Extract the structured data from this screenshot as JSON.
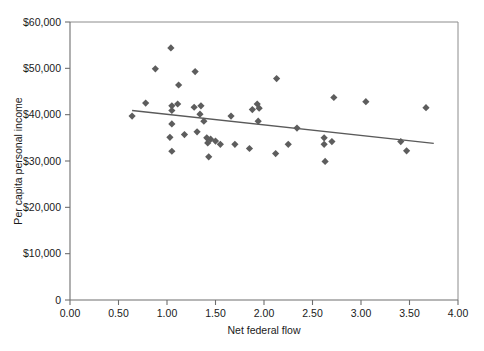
{
  "chart_data": {
    "type": "scatter",
    "title": "",
    "xlabel": "Net federal flow",
    "ylabel": "Per capita personal income",
    "xlim": [
      0,
      4
    ],
    "ylim": [
      0,
      60000
    ],
    "grid": false,
    "legend": null,
    "xticks": [
      "0.00",
      "0.50",
      "1.00",
      "1.50",
      "2.00",
      "2.50",
      "3.00",
      "3.50",
      "4.00"
    ],
    "xtick_values": [
      0,
      0.5,
      1,
      1.5,
      2,
      2.5,
      3,
      3.5,
      4
    ],
    "yticks": [
      "0",
      "$10,000",
      "$20,000",
      "$30,000",
      "$40,000",
      "$50,000",
      "$60,000"
    ],
    "ytick_values": [
      0,
      10000,
      20000,
      30000,
      40000,
      50000,
      60000
    ],
    "marker_shape": "diamond",
    "marker_color": "#5d5d5d",
    "points": [
      {
        "x": 0.64,
        "y": 39700
      },
      {
        "x": 0.78,
        "y": 42500
      },
      {
        "x": 0.88,
        "y": 49900
      },
      {
        "x": 1.04,
        "y": 54400
      },
      {
        "x": 1.05,
        "y": 41900
      },
      {
        "x": 1.11,
        "y": 42300
      },
      {
        "x": 1.05,
        "y": 40900
      },
      {
        "x": 1.12,
        "y": 46400
      },
      {
        "x": 1.05,
        "y": 38000
      },
      {
        "x": 1.03,
        "y": 35100
      },
      {
        "x": 1.18,
        "y": 35700
      },
      {
        "x": 1.05,
        "y": 32100
      },
      {
        "x": 1.29,
        "y": 49300
      },
      {
        "x": 1.28,
        "y": 41600
      },
      {
        "x": 1.35,
        "y": 41900
      },
      {
        "x": 1.34,
        "y": 40100
      },
      {
        "x": 1.38,
        "y": 38600
      },
      {
        "x": 1.31,
        "y": 36300
      },
      {
        "x": 1.41,
        "y": 35000
      },
      {
        "x": 1.45,
        "y": 34700
      },
      {
        "x": 1.5,
        "y": 34300
      },
      {
        "x": 1.42,
        "y": 33900
      },
      {
        "x": 1.55,
        "y": 33600
      },
      {
        "x": 1.43,
        "y": 30900
      },
      {
        "x": 1.66,
        "y": 39700
      },
      {
        "x": 1.7,
        "y": 33600
      },
      {
        "x": 1.88,
        "y": 41100
      },
      {
        "x": 1.93,
        "y": 42300
      },
      {
        "x": 1.95,
        "y": 41400
      },
      {
        "x": 1.94,
        "y": 38600
      },
      {
        "x": 1.85,
        "y": 32700
      },
      {
        "x": 2.13,
        "y": 47800
      },
      {
        "x": 2.12,
        "y": 31600
      },
      {
        "x": 2.25,
        "y": 33600
      },
      {
        "x": 2.34,
        "y": 37100
      },
      {
        "x": 2.62,
        "y": 35000
      },
      {
        "x": 2.7,
        "y": 34200
      },
      {
        "x": 2.62,
        "y": 33600
      },
      {
        "x": 2.72,
        "y": 43700
      },
      {
        "x": 2.63,
        "y": 29900
      },
      {
        "x": 3.05,
        "y": 42800
      },
      {
        "x": 3.41,
        "y": 34200
      },
      {
        "x": 3.47,
        "y": 32200
      },
      {
        "x": 3.67,
        "y": 41500
      }
    ],
    "trendline": {
      "x0": 0.64,
      "y0": 40900,
      "x1": 3.75,
      "y1": 33800,
      "color": "#5a5a5a"
    }
  },
  "caption": {
    "cut_off_text": ""
  }
}
